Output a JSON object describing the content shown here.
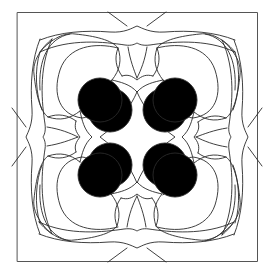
{
  "artwork": {
    "description": "Symmetric line-art stained glass pattern with square frame, four heart-shaped lobes, interlaced petals and central concave diamond",
    "stroke_color": "#2a2a2a",
    "frame_color": "#555555",
    "background": "#ffffff",
    "frame": {
      "x": 17,
      "y": 12,
      "width": 241,
      "height": 250
    },
    "center": {
      "x": 137,
      "y": 137
    },
    "symmetry": 4
  }
}
